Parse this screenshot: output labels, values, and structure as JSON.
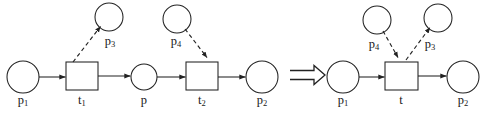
{
  "figure": {
    "stroke_color": "#222222",
    "background_color": "#ffffff",
    "implies_symbol": "⟹",
    "left_net": {
      "name": "source-net",
      "places": [
        {
          "id": "p1",
          "label": "p",
          "sub": "1",
          "cx": 23,
          "cy": 77,
          "r": 16,
          "label_x": 23,
          "label_y": 95
        },
        {
          "id": "p3",
          "label": "p",
          "sub": "3",
          "cx": 109,
          "cy": 17,
          "r": 14,
          "label_x": 110,
          "label_y": 36
        },
        {
          "id": "p",
          "label": "p",
          "sub": "",
          "cx": 144,
          "cy": 77,
          "r": 13,
          "label_x": 144,
          "label_y": 95
        },
        {
          "id": "p4",
          "label": "p",
          "sub": "4",
          "cx": 177,
          "cy": 19,
          "r": 14,
          "label_x": 176,
          "label_y": 36
        },
        {
          "id": "p2",
          "label": "p",
          "sub": "2",
          "cx": 262,
          "cy": 77,
          "r": 16,
          "label_x": 262,
          "label_y": 95
        }
      ],
      "transitions": [
        {
          "id": "t1",
          "label": "t",
          "sub": "1",
          "x": 66,
          "y": 62,
          "w": 32,
          "h": 28,
          "label_x": 82,
          "label_y": 95
        },
        {
          "id": "t2",
          "label": "t",
          "sub": "2",
          "x": 186,
          "y": 62,
          "w": 32,
          "h": 28,
          "label_x": 202,
          "label_y": 95
        }
      ],
      "arcs": [
        {
          "id": "p1-to-t1",
          "kind": "solid",
          "from": "p1",
          "to": "t1"
        },
        {
          "id": "t1-to-p",
          "kind": "solid",
          "from": "t1",
          "to": "p"
        },
        {
          "id": "p-to-t2",
          "kind": "solid",
          "from": "p",
          "to": "t2"
        },
        {
          "id": "t2-to-p2",
          "kind": "solid",
          "from": "t2",
          "to": "p2"
        },
        {
          "id": "t1-to-p3",
          "kind": "dashed",
          "from": "t1",
          "to": "p3"
        },
        {
          "id": "p4-to-t2",
          "kind": "dashed",
          "from": "p4",
          "to": "t2"
        }
      ]
    },
    "right_net": {
      "name": "result-net",
      "places": [
        {
          "id": "p1",
          "label": "p",
          "sub": "1",
          "cx": 343,
          "cy": 77,
          "r": 16,
          "label_x": 343,
          "label_y": 95
        },
        {
          "id": "p4",
          "label": "p",
          "sub": "4",
          "cx": 377,
          "cy": 20,
          "r": 14,
          "label_x": 374,
          "label_y": 39
        },
        {
          "id": "p3",
          "label": "p",
          "sub": "3",
          "cx": 438,
          "cy": 18,
          "r": 14,
          "label_x": 430,
          "label_y": 39
        },
        {
          "id": "p2",
          "label": "p",
          "sub": "2",
          "cx": 463,
          "cy": 77,
          "r": 16,
          "label_x": 463,
          "label_y": 95
        }
      ],
      "transitions": [
        {
          "id": "t",
          "label": "t",
          "sub": "",
          "x": 385,
          "y": 62,
          "w": 33,
          "h": 28,
          "label_x": 401,
          "label_y": 95
        }
      ],
      "arcs": [
        {
          "id": "p1-to-t",
          "kind": "solid",
          "from": "p1",
          "to": "t"
        },
        {
          "id": "t-to-p2",
          "kind": "solid",
          "from": "t",
          "to": "p2"
        },
        {
          "id": "p4-to-t",
          "kind": "dashed",
          "from": "p4",
          "to": "t"
        },
        {
          "id": "t-to-p3",
          "kind": "dashed",
          "from": "t",
          "to": "p3"
        }
      ]
    },
    "implies": {
      "x": 290,
      "y": 75
    }
  }
}
